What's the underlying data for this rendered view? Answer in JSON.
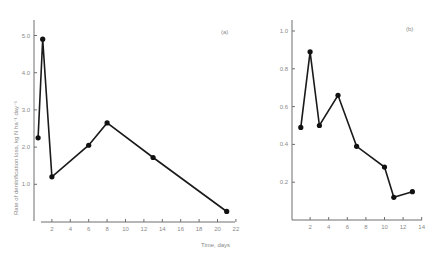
{
  "chart_data": [
    {
      "type": "line",
      "panel_label": "(a)",
      "title": "",
      "xlabel": "Time, days",
      "ylabel": "Rate of denitrification loss, kg N ha⁻¹ day⁻¹",
      "xlim": [
        0,
        22
      ],
      "ylim": [
        0,
        5.3
      ],
      "x_ticks": [
        2,
        4,
        6,
        8,
        10,
        12,
        14,
        16,
        18,
        20,
        22
      ],
      "x_tick_labels": [
        "2",
        "4",
        "6",
        "8",
        "10",
        "12",
        "14",
        "16",
        "18",
        "20",
        "22"
      ],
      "y_ticks": [
        1.0,
        2.0,
        3.0,
        4.0,
        5.0
      ],
      "y_tick_labels": [
        "1.0",
        "2.0",
        "3.0",
        "4.0",
        "5.0"
      ],
      "grid": false,
      "series": [
        {
          "name": "denitrification loss (a)",
          "x": [
            0.5,
            1,
            2,
            6,
            8,
            13,
            21
          ],
          "values": [
            2.25,
            4.9,
            1.2,
            2.05,
            2.65,
            1.72,
            0.27
          ]
        }
      ]
    },
    {
      "type": "line",
      "panel_label": "(b)",
      "title": "",
      "xlabel": "",
      "ylabel": "",
      "xlim": [
        0,
        14
      ],
      "ylim": [
        0,
        1.05
      ],
      "x_ticks": [
        2,
        4,
        6,
        8,
        10,
        12,
        14
      ],
      "x_tick_labels": [
        "2",
        "4",
        "6",
        "8",
        "10",
        "12",
        "14"
      ],
      "y_ticks": [
        0.2,
        0.4,
        0.6,
        0.8,
        1.0
      ],
      "y_tick_labels": [
        "0.2",
        "0.4",
        "0.6",
        "0.8",
        "1.0"
      ],
      "grid": false,
      "series": [
        {
          "name": "denitrification loss (b)",
          "x": [
            1,
            2,
            3,
            5,
            7,
            10,
            11,
            13
          ],
          "values": [
            0.49,
            0.89,
            0.5,
            0.66,
            0.39,
            0.28,
            0.12,
            0.15
          ]
        }
      ]
    }
  ],
  "labels": {
    "panel_a": "(a)",
    "panel_b": "(b)",
    "xlabel": "Time, days",
    "ylabel": "Rate of denitrification loss, kg N ha⁻¹ day⁻¹"
  }
}
